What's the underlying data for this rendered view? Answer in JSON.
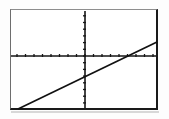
{
  "figure": {
    "name": "line-graph",
    "background_color": "#ffffff",
    "frame_color": "#1a1a1a",
    "axis_color": "#161616",
    "line_color": "#111111"
  },
  "chart_data": {
    "type": "line",
    "title": "",
    "subtitle": "",
    "xlabel": "",
    "ylabel": "",
    "grid": false,
    "legend": null,
    "axes": {
      "x_axis_visible": true,
      "y_axis_visible": true,
      "x_axis_pixel_y": 56,
      "y_axis_pixel_x": 85,
      "x_tick_count": 17,
      "y_tick_count": 15,
      "x_tick_spacing_px": 8.5,
      "y_tick_spacing_px": 6.7,
      "tick_length_px": 4
    },
    "xlim": [
      -8.8,
      8.6
    ],
    "ylim": [
      -7.9,
      6.8
    ],
    "series": [
      {
        "name": "line",
        "slope": 0.48,
        "intercept": -2.3,
        "x": [
          -8.0,
          8.5
        ],
        "y": [
          -6.1,
          1.8
        ],
        "x_intercept": 4.6,
        "y_intercept": -2.3,
        "pixel_start": [
          18,
          109
        ],
        "pixel_end": [
          157,
          42
        ]
      }
    ]
  }
}
